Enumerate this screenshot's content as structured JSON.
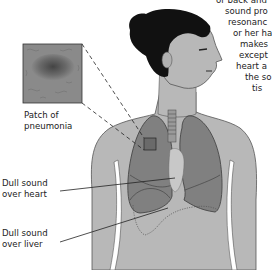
{
  "figure": {
    "colors": {
      "background": "#ffffff",
      "skin": "#b8b8b8",
      "skin_outline": "#555555",
      "hair": "#111111",
      "lung_fill": "#7a7a7a",
      "lung_outline": "#3a3a3a",
      "inset_fill": "#8a8a8a",
      "text": "#222222"
    }
  },
  "labels": {
    "pneumonia": {
      "line1": "Patch of",
      "line2": "pneumonia"
    },
    "heart": {
      "line1": "Dull sound",
      "line2": "over heart"
    },
    "liver": {
      "line1": "Dull sound",
      "line2": "over liver"
    }
  },
  "side_text": {
    "lines": [
      "or back and",
      "sound pro",
      "resonanc",
      "or her ha",
      "makes",
      "except",
      "heart a",
      "the so",
      "tis"
    ]
  }
}
